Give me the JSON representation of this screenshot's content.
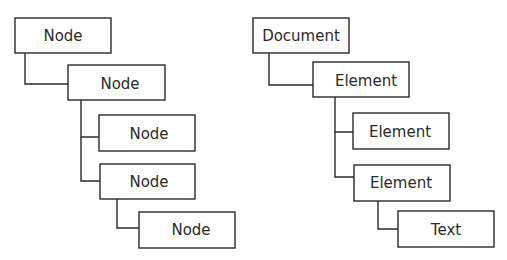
{
  "diagram": {
    "type": "tree",
    "trees": [
      {
        "name": "generic-node-tree",
        "nodes": [
          {
            "id": "n1",
            "label": "Node",
            "parent": null
          },
          {
            "id": "n2",
            "label": "Node",
            "parent": "n1"
          },
          {
            "id": "n3",
            "label": "Node",
            "parent": "n2"
          },
          {
            "id": "n4",
            "label": "Node",
            "parent": "n2"
          },
          {
            "id": "n5",
            "label": "Node",
            "parent": "n4"
          }
        ]
      },
      {
        "name": "dom-tree",
        "nodes": [
          {
            "id": "d1",
            "label": "Document",
            "parent": null
          },
          {
            "id": "d2",
            "label": "Element",
            "parent": "d1"
          },
          {
            "id": "d3",
            "label": "Element",
            "parent": "d2"
          },
          {
            "id": "d4",
            "label": "Element",
            "parent": "d2"
          },
          {
            "id": "d5",
            "label": "Text",
            "parent": "d4"
          }
        ]
      }
    ]
  }
}
